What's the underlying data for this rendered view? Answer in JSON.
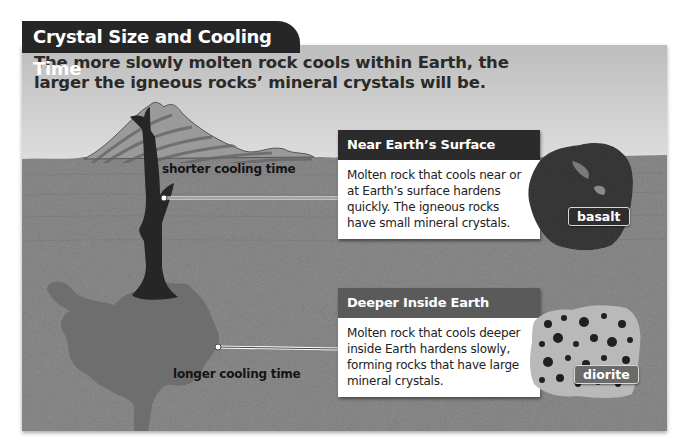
{
  "figure": {
    "title": "Crystal Size and Cooling Time",
    "subtitle": "The more slowly molten rock cools within Earth, the larger the igneous rocks’ mineral crystals will be."
  },
  "diagram": {
    "labels": {
      "shorter": "shorter cooling time",
      "longer": "longer cooling time"
    }
  },
  "cards": [
    {
      "heading": "Near Earth’s Surface",
      "body": "Molten rock that cools near or at Earth’s surface hardens quickly. The igneous rocks have small mineral crystals.",
      "rock_label": "basalt",
      "header_color": "#2b2b2b"
    },
    {
      "heading": "Deeper Inside Earth",
      "body": "Molten rock that cools deeper inside Earth hardens slowly, forming rocks that have large mineral crystals.",
      "rock_label": "diorite",
      "header_color": "#5a5a5a"
    }
  ],
  "colors": {
    "title_bg": "#262626",
    "ground": "#8c8c8c",
    "magma": "#6e6e6e",
    "conduit": "#2a2a2a"
  }
}
